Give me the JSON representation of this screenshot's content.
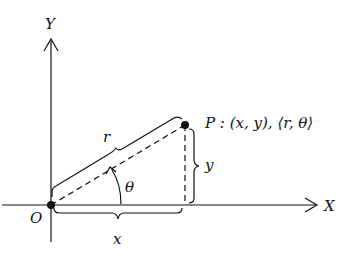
{
  "diagram": {
    "axes": {
      "x_label": "X",
      "y_label": "Y",
      "origin_label": "O"
    },
    "point": {
      "name": "P",
      "label": "P : (x, y), ⟨r, θ⟩"
    },
    "segments": {
      "r_label": "r",
      "x_label": "x",
      "y_label": "y",
      "angle_label": "θ"
    },
    "colors": {
      "ink": "#111111",
      "background": "#ffffff"
    }
  }
}
